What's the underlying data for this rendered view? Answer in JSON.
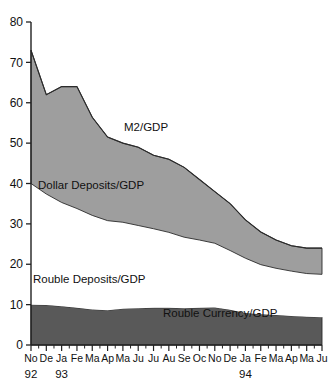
{
  "chart_data": {
    "type": "area",
    "title": "",
    "subtitle": "",
    "xlabel": "",
    "ylabel": "",
    "stacked": true,
    "grid": false,
    "legend_position": "inline-annotations",
    "ylim": [
      0,
      80
    ],
    "ytick_step": 10,
    "yticks": [
      "0",
      "10",
      "20",
      "30",
      "40",
      "50",
      "60",
      "70",
      "80"
    ],
    "x": [
      "No",
      "De",
      "Ja",
      "Fe",
      "Ma",
      "Ap",
      "Ma",
      "Ju",
      "Ju",
      "Au",
      "Se",
      "Oc",
      "No",
      "De",
      "Ja",
      "Fe",
      "Ma",
      "Ap",
      "Ma",
      "Ju"
    ],
    "xtick_labels": [
      "No",
      "De",
      "Ja",
      "Fe",
      "Ma",
      "Ap",
      "Ma",
      "Ju",
      "Ju",
      "Au",
      "Se",
      "Oc",
      "No",
      "De",
      "Ja",
      "Fe",
      "Ma",
      "Ap",
      "Ma",
      "Ju"
    ],
    "year_labels": [
      {
        "text": "92",
        "at_index": 0
      },
      {
        "text": "93",
        "at_index": 2
      },
      {
        "text": "94",
        "at_index": 14
      }
    ],
    "annotations": [
      {
        "text": "M2/GDP",
        "x_px": 124,
        "y_px": 131
      },
      {
        "text": "Dollar Deposits/GDP",
        "x_px": 38,
        "y_px": 189
      },
      {
        "text": "Rouble Deposits/GDP",
        "x_px": 33,
        "y_px": 283
      },
      {
        "text": "Rouble Currency/GDP",
        "x_px": 163,
        "y_px": 317
      }
    ],
    "series": [
      {
        "name": "Rouble Currency/GDP",
        "color": "#595959",
        "stack_order": 1,
        "values": [
          10.0,
          9.9,
          9.6,
          9.2,
          8.8,
          8.6,
          9.0,
          9.1,
          9.2,
          9.2,
          9.1,
          9.2,
          9.3,
          8.7,
          7.9,
          7.6,
          7.4,
          7.2,
          7.0,
          6.9
        ]
      },
      {
        "name": "Rouble Deposits/GDP",
        "color": "#ffffff",
        "stack_order": 2,
        "values": [
          30.0,
          27.5,
          25.7,
          24.6,
          23.3,
          22.2,
          21.4,
          20.5,
          19.6,
          18.7,
          17.6,
          16.8,
          15.9,
          14.7,
          13.6,
          12.3,
          11.6,
          11.1,
          10.7,
          10.6
        ]
      },
      {
        "name": "Dollar Deposits/GDP",
        "color": "#9e9e9e",
        "stack_order": 3,
        "values": [
          33.0,
          24.6,
          28.7,
          30.2,
          24.3,
          20.7,
          19.6,
          19.4,
          18.2,
          18.1,
          17.3,
          15.0,
          12.8,
          11.6,
          9.5,
          8.1,
          7.0,
          6.3,
          6.3,
          6.5
        ]
      }
    ],
    "total_series": {
      "name": "M2/GDP",
      "values": [
        73.0,
        62.0,
        64.0,
        64.0,
        56.4,
        51.5,
        50.0,
        49.0,
        47.0,
        46.0,
        44.0,
        41.0,
        38.0,
        35.0,
        31.0,
        28.0,
        26.0,
        24.6,
        24.0,
        24.0
      ]
    }
  }
}
